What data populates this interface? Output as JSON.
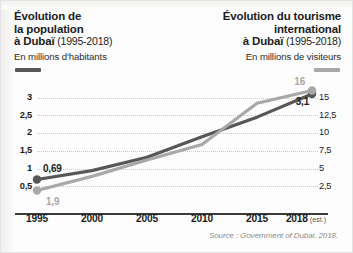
{
  "titles": {
    "left": {
      "line1": "Évolution de",
      "line2": "la population",
      "line3_bold": "à Dubaï",
      "line3_years": " (1995-2018)",
      "subtitle": "En millions d'habitants",
      "color": "#575757"
    },
    "right": {
      "line1": "Évolution du tourisme",
      "line2": "international",
      "line3_bold": "à Dubaï",
      "line3_years": " (1995-2018)",
      "subtitle": "En millions de visiteurs",
      "color": "#a8a8a8"
    }
  },
  "source": "Source : Government of Dubai, 2018.",
  "chart_data": {
    "type": "line",
    "xlabel": "",
    "x": [
      1995,
      2000,
      2005,
      2010,
      2015,
      2018
    ],
    "xtick_labels": [
      "1995",
      "2000",
      "2005",
      "2010",
      "2015",
      "2018"
    ],
    "xtick_suffix_last": "(est.)",
    "grid": true,
    "legend_position": "top",
    "series": [
      {
        "name": "Population (millions d'habitants)",
        "axis": "left",
        "color": "#575757",
        "values": [
          0.69,
          0.94,
          1.32,
          1.9,
          2.45,
          3.1
        ],
        "start_label": "0,69",
        "end_label": "3,1",
        "ylabel": "En millions d'habitants",
        "ylim": [
          0,
          3.3
        ],
        "ytick_labels": [
          "0,5",
          "1",
          "1,5",
          "2",
          "2,5",
          "3"
        ],
        "ytick_values": [
          0.5,
          1,
          1.5,
          2,
          2.5,
          3
        ]
      },
      {
        "name": "Tourisme international (millions de visiteurs)",
        "axis": "right",
        "color": "#a8a8a8",
        "values": [
          1.9,
          3.9,
          6.2,
          8.4,
          14.2,
          16
        ],
        "start_label": "1,9",
        "end_label": "16",
        "ylabel": "En millions de visiteurs",
        "ylim": [
          0,
          16.5
        ],
        "ytick_labels": [
          "2,5",
          "5",
          "7,5",
          "10",
          "12,5",
          "15"
        ],
        "ytick_values": [
          2.5,
          5,
          7.5,
          10,
          12.5,
          15
        ]
      }
    ]
  }
}
